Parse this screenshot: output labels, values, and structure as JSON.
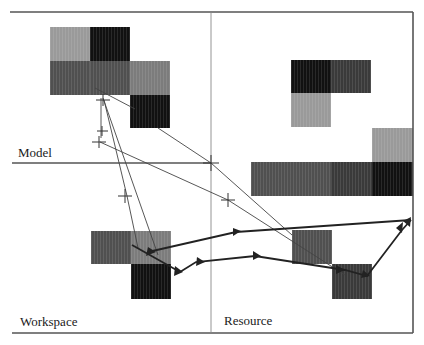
{
  "quadrants": {
    "model": {
      "label": "Model"
    },
    "workspace": {
      "label": "Workspace"
    },
    "resource": {
      "label": "Resource"
    }
  },
  "colors": {
    "light": "#9a9a9a",
    "medium": "#7c7c7c",
    "dark": "#505050",
    "darker": "#3a3a3a",
    "black": "#111111",
    "line": "#333333",
    "frame": "#555555"
  },
  "blocks": {
    "model_cluster": [
      {
        "x": 50,
        "y": 27,
        "w": 40,
        "h": 34,
        "shade": "light"
      },
      {
        "x": 90,
        "y": 27,
        "w": 40,
        "h": 34,
        "shade": "black"
      },
      {
        "x": 50,
        "y": 61,
        "w": 40,
        "h": 34,
        "shade": "dark"
      },
      {
        "x": 90,
        "y": 61,
        "w": 40,
        "h": 34,
        "shade": "dark"
      },
      {
        "x": 130,
        "y": 61,
        "w": 40,
        "h": 34,
        "shade": "medium"
      },
      {
        "x": 130,
        "y": 95,
        "w": 40,
        "h": 33,
        "shade": "black"
      }
    ],
    "resource_model_cluster": [
      {
        "x": 291,
        "y": 60,
        "w": 40,
        "h": 33,
        "shade": "black"
      },
      {
        "x": 331,
        "y": 60,
        "w": 40,
        "h": 33,
        "shade": "darker"
      },
      {
        "x": 291,
        "y": 93,
        "w": 40,
        "h": 34,
        "shade": "light"
      },
      {
        "x": 372,
        "y": 128,
        "w": 41,
        "h": 34,
        "shade": "light"
      },
      {
        "x": 251,
        "y": 162,
        "w": 80,
        "h": 34,
        "shade": "dark"
      },
      {
        "x": 331,
        "y": 162,
        "w": 41,
        "h": 34,
        "shade": "darker"
      },
      {
        "x": 372,
        "y": 162,
        "w": 41,
        "h": 34,
        "shade": "black"
      }
    ],
    "workspace_cluster": [
      {
        "x": 91,
        "y": 231,
        "w": 40,
        "h": 33,
        "shade": "dark"
      },
      {
        "x": 131,
        "y": 231,
        "w": 40,
        "h": 33,
        "shade": "medium"
      },
      {
        "x": 131,
        "y": 264,
        "w": 40,
        "h": 35,
        "shade": "black"
      }
    ],
    "resource_cluster": [
      {
        "x": 292,
        "y": 230,
        "w": 40,
        "h": 34,
        "shade": "dark"
      },
      {
        "x": 332,
        "y": 264,
        "w": 40,
        "h": 35,
        "shade": "darker"
      }
    ]
  }
}
